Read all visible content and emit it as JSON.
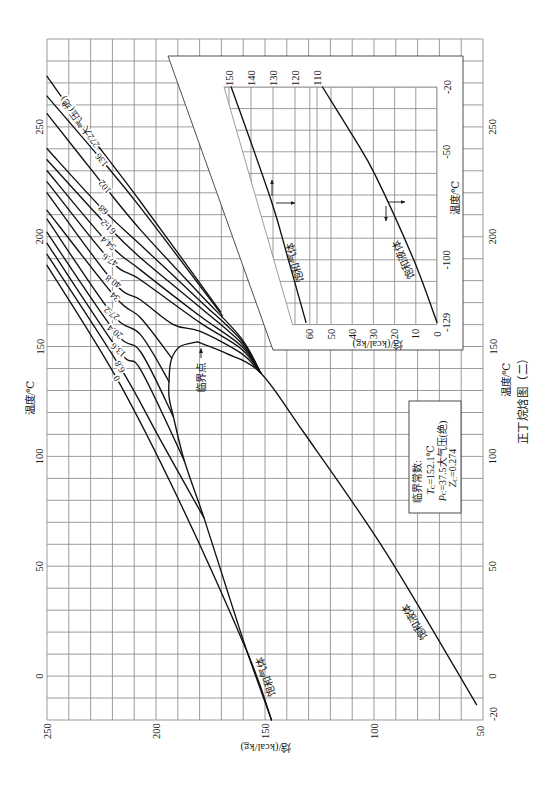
{
  "figure": {
    "caption": "正丁烷焓图（二）"
  },
  "chart_data": {
    "type": "line",
    "title": "正丁烷焓图（二）",
    "xlabel": "温度/℃",
    "ylabel": "焓/(kcal/kg)",
    "orientation": "rotated 90° counter-clockwise (temperature axis vertical, enthalpy axis horizontal)",
    "point_format": "[temperature_C, enthalpy_kcal_per_kg]",
    "xlim": [
      -20,
      290
    ],
    "ylim": [
      50,
      250
    ],
    "x_ticks": [
      -20,
      0,
      50,
      100,
      150,
      200,
      250
    ],
    "x_ticks_opposite": [
      0,
      50,
      100,
      150,
      200,
      250
    ],
    "y_ticks": [
      50,
      100,
      150,
      200,
      250
    ],
    "grid": true,
    "grid_step": {
      "x": 10,
      "y": 10
    },
    "pressure_unit": "大气压(绝)",
    "series": [
      {
        "name": "饱和气体",
        "kind": "saturated-vapor",
        "points": [
          [
            -20,
            147
          ],
          [
            10.5,
            158
          ],
          [
            41,
            168
          ],
          [
            72,
            178
          ],
          [
            98,
            187
          ],
          [
            118,
            192
          ],
          [
            127,
            194
          ],
          [
            135,
            194
          ],
          [
            144,
            193
          ],
          [
            150,
            189
          ],
          [
            152.1,
            181
          ]
        ]
      },
      {
        "name": "饱和液体",
        "kind": "saturated-liquid",
        "points": [
          [
            152.1,
            181
          ],
          [
            147,
            168
          ],
          [
            138,
            152
          ],
          [
            112,
            133
          ],
          [
            57,
            95
          ],
          [
            -13,
            53
          ]
        ]
      },
      {
        "name": "0 大气压(绝)",
        "kind": "isobar",
        "pressure_atm": 0,
        "label": "0",
        "label_at": [
          135.5,
          218
        ],
        "points": [
          [
            187,
            250
          ],
          [
            135.5,
            218
          ],
          [
            79,
            189
          ],
          [
            10.5,
            158
          ],
          [
            -20,
            147
          ]
        ]
      },
      {
        "name": "6.8 大气压(绝)",
        "kind": "isobar",
        "pressure_atm": 6.8,
        "label": "6.8",
        "label_at": [
          140.8,
          216.5
        ],
        "points": [
          [
            192,
            250
          ],
          [
            140.8,
            216.5
          ],
          [
            107.5,
            198
          ],
          [
            72,
            178
          ]
        ]
      },
      {
        "name": "13.6 大气压(绝)",
        "kind": "isobar",
        "pressure_atm": 13.6,
        "label": "13.6",
        "label_at": [
          148.4,
          217.3
        ],
        "points": [
          [
            197,
            250
          ],
          [
            148.4,
            217.3
          ],
          [
            139.4,
            207
          ],
          [
            98,
            187
          ]
        ]
      },
      {
        "name": "20.4 大气压(绝)",
        "kind": "isobar",
        "pressure_atm": 20.4,
        "label": "20.4",
        "label_at": [
          156.7,
          218.8
        ],
        "points": [
          [
            202,
            250
          ],
          [
            156.7,
            218.8
          ],
          [
            147.5,
            207
          ],
          [
            118,
            192
          ]
        ]
      },
      {
        "name": "27.2 大气压(绝)",
        "kind": "isobar",
        "pressure_atm": 27.2,
        "label": "27.2",
        "label_at": [
          165.1,
          220.3
        ],
        "points": [
          [
            208,
            250
          ],
          [
            165.1,
            220.3
          ],
          [
            155.3,
            207
          ],
          [
            134,
            194
          ]
        ]
      },
      {
        "name": "34 大气压(绝)",
        "kind": "isobar",
        "pressure_atm": 34,
        "label": "34",
        "label_at": [
          172.7,
          218.8
        ],
        "points": [
          [
            212,
            250
          ],
          [
            172.7,
            218.8
          ],
          [
            163,
            207
          ],
          [
            145,
            193
          ]
        ]
      },
      {
        "name": "40.8 大气压(绝)",
        "kind": "isobar",
        "pressure_atm": 40.8,
        "label": "40.8",
        "label_at": [
          179.5,
          219.6
        ],
        "points": [
          [
            220,
            250
          ],
          [
            179.5,
            219.6
          ],
          [
            171.2,
            207
          ],
          [
            160,
            192
          ],
          [
            157,
            180
          ],
          [
            147,
            161
          ],
          [
            138,
            152
          ]
        ]
      },
      {
        "name": "47.6 大气压(绝)",
        "kind": "isobar",
        "pressure_atm": 47.6,
        "label": "47.6",
        "label_at": [
          189.4,
          221.1
        ],
        "points": [
          [
            225,
            250
          ],
          [
            189.4,
            221.1
          ],
          [
            180.3,
            207
          ],
          [
            161,
            180
          ],
          [
            149,
            161
          ],
          [
            138,
            152
          ]
        ]
      },
      {
        "name": "54.4 大气压(绝)",
        "kind": "isobar",
        "pressure_atm": 54.4,
        "label": "54.4",
        "label_at": [
          197,
          221.9
        ],
        "points": [
          [
            230,
            250
          ],
          [
            197,
            221.9
          ],
          [
            184.8,
            207
          ],
          [
            164,
            180
          ],
          [
            150.4,
            161
          ],
          [
            138,
            152
          ]
        ]
      },
      {
        "name": "61.2 大气压(绝)",
        "kind": "isobar",
        "pressure_atm": 61.2,
        "label": "61.2",
        "label_at": [
          204.5,
          221.9
        ],
        "points": [
          [
            235,
            250
          ],
          [
            204.5,
            221.9
          ],
          [
            190.3,
            207
          ],
          [
            168,
            180
          ],
          [
            151.7,
            161
          ],
          [
            138,
            152
          ]
        ]
      },
      {
        "name": "68 大气压(绝)",
        "kind": "isobar",
        "pressure_atm": 68,
        "label": "68",
        "label_at": [
          212.2,
          224.2
        ],
        "points": [
          [
            240,
            250
          ],
          [
            212.2,
            224.2
          ],
          [
            196.2,
            207
          ],
          [
            171,
            180
          ],
          [
            153,
            161
          ],
          [
            138,
            152
          ]
        ]
      },
      {
        "name": "102 大气压(绝)",
        "kind": "isobar",
        "pressure_atm": 102,
        "label": "102",
        "label_at": [
          222.7,
          223.4
        ],
        "points": [
          [
            256,
            250
          ],
          [
            222.7,
            223.4
          ],
          [
            203,
            207
          ],
          [
            174,
            180
          ],
          [
            154,
            161
          ],
          [
            138,
            152
          ]
        ]
      },
      {
        "name": "136 大气压(绝)",
        "kind": "isobar",
        "pressure_atm": 136,
        "label": "136",
        "label_at": [
          234.9,
          224.9
        ],
        "points": [
          [
            264,
            250
          ],
          [
            234.9,
            224.9
          ],
          [
            213.1,
            207
          ],
          [
            164,
            169.5
          ]
        ]
      },
      {
        "name": "272 大气压(绝)",
        "kind": "isobar",
        "pressure_atm": 272,
        "label": "272大气压(绝)",
        "label_at": [
          252.2,
          234.9
        ],
        "points": [
          [
            273,
            250
          ],
          [
            252.2,
            234.9
          ],
          [
            215.8,
            207
          ],
          [
            166,
            170.5
          ]
        ]
      }
    ],
    "critical_point": {
      "T": 152.1,
      "H": 181
    },
    "annotations": [
      {
        "text": "临界点",
        "target": [
          152.1,
          181
        ]
      }
    ],
    "critical_constants": {
      "title": "临界常数:",
      "items": [
        {
          "symbol": "T",
          "subscript": "C",
          "value": "=152.1℃"
        },
        {
          "symbol": "P",
          "subscript": "C",
          "value": "=37.5大气压(绝)"
        },
        {
          "symbol": "Z",
          "subscript": "C",
          "value": "=0.274"
        }
      ]
    },
    "inset": {
      "xlabel": "温度/℃",
      "ylabel": "焓/(kcal/kg)",
      "xlim": [
        -130,
        -20
      ],
      "x_ticks": [
        -129,
        -100,
        -50,
        -20
      ],
      "ylim_lower": [
        0,
        60
      ],
      "ylim_upper": [
        110,
        150
      ],
      "y_ticks_lower": [
        0,
        10,
        20,
        30,
        40,
        50,
        60
      ],
      "y_ticks_upper": [
        110,
        120,
        130,
        140,
        150
      ],
      "grid_step": {
        "x": 10,
        "y": 10
      },
      "series": [
        {
          "name": "饱和气体",
          "kind": "saturated-vapor",
          "axis": "upper",
          "points": [
            [
              -20,
              149
            ],
            [
              -72,
              131
            ],
            [
              -100,
              123
            ],
            [
              -129,
              115
            ]
          ]
        },
        {
          "name": "饱和液体",
          "kind": "saturated-liquid",
          "axis": "lower",
          "points": [
            [
              -20,
              54
            ],
            [
              -43,
              39.5
            ],
            [
              -61,
              29
            ],
            [
              -100,
              11
            ],
            [
              -129,
              0
            ]
          ]
        }
      ]
    }
  }
}
